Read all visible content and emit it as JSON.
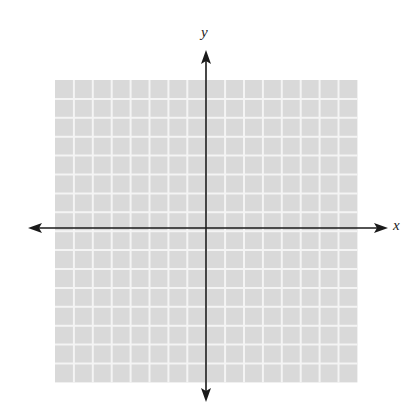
{
  "figure": {
    "type": "coordinate-plane",
    "grid": {
      "columns": 16,
      "rows": 16,
      "left": 55,
      "top": 80,
      "cell": 18.9,
      "fill": "#d9d9d9",
      "line": "#f4f4f4"
    },
    "axes": {
      "origin_x": 206,
      "origin_y": 228,
      "color": "#1a1a1a",
      "x_label": "x",
      "y_label": "y",
      "x_start": 28,
      "x_end": 388,
      "y_start": 50,
      "y_end": 402
    }
  }
}
